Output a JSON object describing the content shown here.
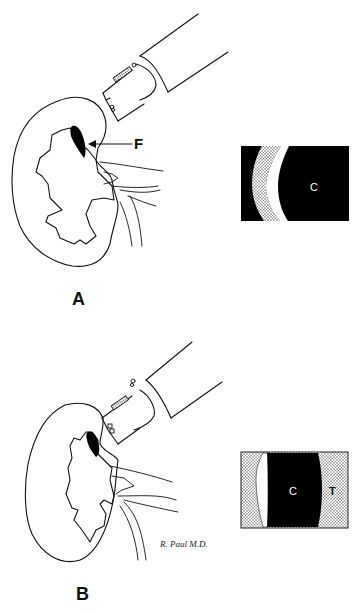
{
  "figure": {
    "panels": [
      {
        "id": "A",
        "label": "A",
        "callout_label": "F",
        "inset": {
          "center_label": "C",
          "side_label": ""
        }
      },
      {
        "id": "B",
        "label": "B",
        "callout_label": "",
        "inset": {
          "center_label": "C",
          "side_label": "T"
        },
        "signature": "R. Paul M.D."
      }
    ],
    "colors": {
      "line": "#111111",
      "fill_dark": "#000000",
      "stipple": "#c8c8c8",
      "background": "#ffffff"
    }
  }
}
